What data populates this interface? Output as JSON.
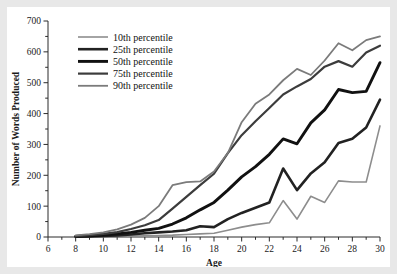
{
  "chart_data": {
    "type": "line",
    "title": "",
    "xlabel": "Age",
    "ylabel": "Number of Words Produced",
    "xlim": [
      6,
      30
    ],
    "ylim": [
      0,
      700
    ],
    "xticks": [
      6,
      8,
      10,
      12,
      14,
      16,
      18,
      20,
      22,
      24,
      26,
      28,
      30
    ],
    "yticks": [
      0,
      100,
      200,
      300,
      400,
      500,
      600,
      700
    ],
    "x_minor_ticks": [
      7,
      9,
      11,
      13,
      15,
      17,
      19,
      21,
      23,
      25,
      27,
      29
    ],
    "y_minor_ticks": [
      50,
      150,
      250,
      350,
      450,
      550,
      650
    ],
    "grid": false,
    "legend_position": "upper-left",
    "x": [
      8,
      9,
      10,
      11,
      12,
      13,
      14,
      15,
      16,
      17,
      18,
      19,
      20,
      21,
      22,
      23,
      24,
      25,
      26,
      27,
      28,
      29,
      30
    ],
    "series": [
      {
        "name": "10th percentile",
        "color": "#8d8d8d",
        "width": 1.6,
        "values": [
          0,
          0,
          1,
          2,
          3,
          4,
          5,
          6,
          8,
          10,
          12,
          22,
          32,
          40,
          46,
          118,
          58,
          132,
          112,
          182,
          178,
          178,
          360
        ]
      },
      {
        "name": "25th percentile",
        "color": "#222222",
        "width": 2.6,
        "values": [
          1,
          2,
          3,
          5,
          8,
          12,
          15,
          18,
          22,
          35,
          32,
          58,
          78,
          95,
          112,
          222,
          152,
          206,
          242,
          305,
          318,
          355,
          445
        ]
      },
      {
        "name": "50th percentile",
        "color": "#111111",
        "width": 2.9,
        "values": [
          2,
          4,
          6,
          10,
          15,
          22,
          28,
          42,
          62,
          88,
          112,
          152,
          195,
          228,
          268,
          318,
          302,
          370,
          412,
          478,
          468,
          472,
          565
        ]
      },
      {
        "name": "75th percentile",
        "color": "#3c3c3c",
        "width": 2.2,
        "values": [
          3,
          6,
          10,
          16,
          26,
          38,
          55,
          92,
          130,
          168,
          205,
          272,
          330,
          375,
          418,
          462,
          488,
          512,
          552,
          570,
          552,
          598,
          620
        ]
      },
      {
        "name": "90th percentile",
        "color": "#7b7b7b",
        "width": 1.8,
        "values": [
          5,
          9,
          15,
          25,
          40,
          62,
          100,
          168,
          178,
          180,
          212,
          272,
          372,
          432,
          462,
          508,
          545,
          525,
          572,
          628,
          605,
          638,
          650
        ]
      }
    ]
  },
  "legend": {
    "items": [
      {
        "label": "10th percentile"
      },
      {
        "label": "25th percentile"
      },
      {
        "label": "50th percentile"
      },
      {
        "label": "75th percentile"
      },
      {
        "label": "90th percentile"
      }
    ]
  },
  "axis": {
    "x_title": "Age",
    "y_title": "Number of Words Produced"
  }
}
